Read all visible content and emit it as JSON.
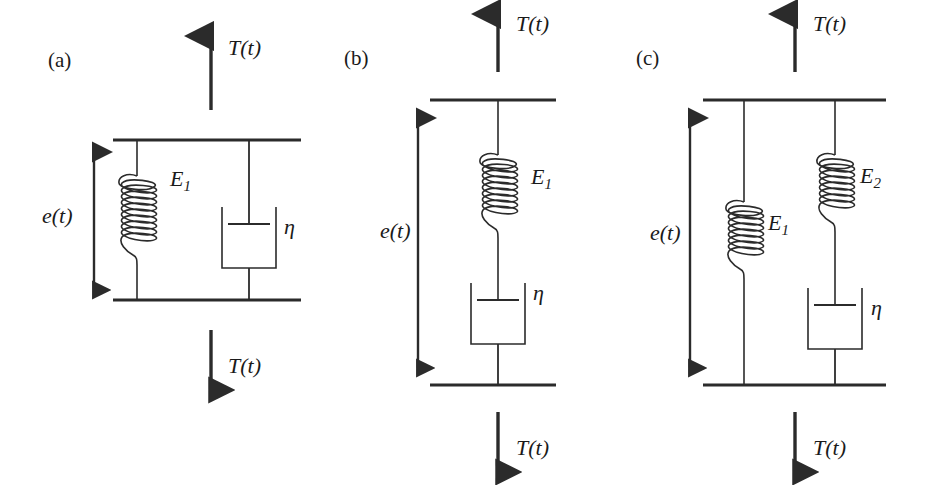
{
  "figure": {
    "background_color": "#ffffff",
    "ink_color": "#2b2b2b"
  },
  "panels": [
    {
      "id": "a",
      "letter": "(a)",
      "model_name": "Kelvin-Voigt model",
      "strain_label": "e(t)",
      "force_label_top": "T(t)",
      "force_label_bottom": "T(t)",
      "elements": [
        {
          "kind": "spring",
          "label": "E",
          "subscript": "1"
        },
        {
          "kind": "dashpot",
          "label": "η",
          "subscript": ""
        }
      ],
      "arrangement": "parallel"
    },
    {
      "id": "b",
      "letter": "(b)",
      "model_name": "Maxwell model",
      "strain_label": "e(t)",
      "force_label_top": "T(t)",
      "force_label_bottom": "T(t)",
      "elements": [
        {
          "kind": "spring",
          "label": "E",
          "subscript": "1"
        },
        {
          "kind": "dashpot",
          "label": "η",
          "subscript": ""
        }
      ],
      "arrangement": "series"
    },
    {
      "id": "c",
      "letter": "(c)",
      "model_name": "Standard linear solid model",
      "strain_label": "e(t)",
      "force_label_top": "T(t)",
      "force_label_bottom": "T(t)",
      "elements": [
        {
          "kind": "spring",
          "label": "E",
          "subscript": "1"
        },
        {
          "kind": "spring",
          "label": "E",
          "subscript": "2"
        },
        {
          "kind": "dashpot",
          "label": "η",
          "subscript": ""
        }
      ],
      "arrangement": "spring parallel with spring-dashpot series"
    }
  ]
}
